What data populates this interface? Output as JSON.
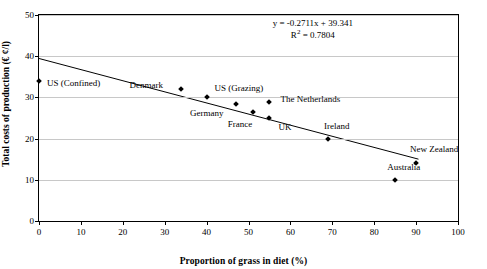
{
  "chart_data": {
    "type": "scatter",
    "title": "",
    "xlabel": "Proportion of grass in diet (%)",
    "ylabel": "Total costs of production (€ ¢/l)",
    "xlim": [
      0,
      100
    ],
    "ylim": [
      0,
      50
    ],
    "xticks": [
      0,
      10,
      20,
      30,
      40,
      50,
      60,
      70,
      80,
      90,
      100
    ],
    "yticks": [
      0,
      10,
      20,
      30,
      40,
      50
    ],
    "grid": "horizontal",
    "legend": "none",
    "annotations": {
      "equation": "y = -0.2711x + 39.341",
      "r_squared_prefix": "R",
      "r_squared_sup": "2",
      "r_squared_value": " = 0.7804"
    },
    "trendline": {
      "slope": -0.2711,
      "intercept": 39.341,
      "x_start": 0,
      "x_end": 91
    },
    "points": [
      {
        "label": "US (Confined)",
        "x": 0,
        "y": 34.0,
        "label_dx": 8,
        "label_dy": 4
      },
      {
        "label": "Denmark",
        "x": 34,
        "y": 32.0,
        "label_dx": -52,
        "label_dy": -2
      },
      {
        "label": "US (Grazing)",
        "x": 40,
        "y": 30.0,
        "label_dx": 8,
        "label_dy": -7
      },
      {
        "label": "Germany",
        "x": 47,
        "y": 28.5,
        "label_dx": -46,
        "label_dy": 11
      },
      {
        "label": "The Netherlands",
        "x": 55,
        "y": 29.0,
        "label_dx": 11,
        "label_dy": -1
      },
      {
        "label": "France",
        "x": 51,
        "y": 26.5,
        "label_dx": -25,
        "label_dy": 14
      },
      {
        "label": "UK",
        "x": 55,
        "y": 25.0,
        "label_dx": 9,
        "label_dy": 11
      },
      {
        "label": "Ireland",
        "x": 69,
        "y": 20.0,
        "label_dx": -4,
        "label_dy": -11
      },
      {
        "label": "New Zealand",
        "x": 90,
        "y": 14.0,
        "label_dx": -6,
        "label_dy": -12
      },
      {
        "label": "Australia",
        "x": 85,
        "y": 10.0,
        "label_dx": -8,
        "label_dy": -11
      }
    ]
  }
}
